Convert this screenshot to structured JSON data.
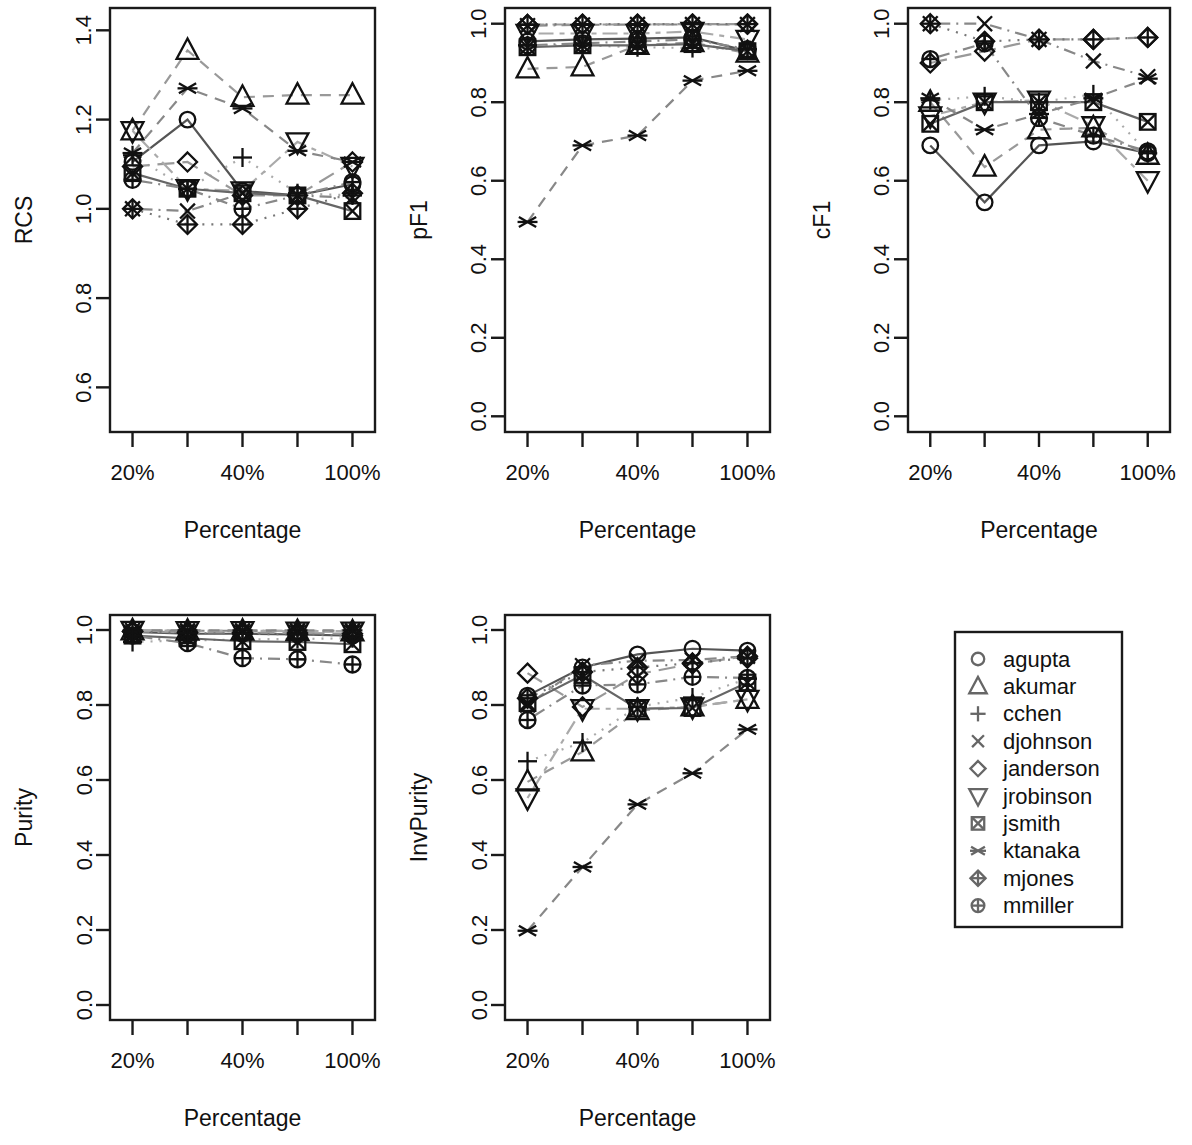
{
  "figure": {
    "type": "multi-panel-line-chart",
    "panel_count": 5,
    "x_axis_label": "Percentage",
    "x_categories": [
      "20%",
      "30%",
      "40%",
      "50%",
      "100%"
    ],
    "x_tick_labels_shown": [
      "20%",
      "",
      "40%",
      "",
      "100%"
    ]
  },
  "legend": {
    "box": true,
    "position": "bottom-right",
    "entries": [
      {
        "label": "agupta",
        "symbol": "circle",
        "pch": 1,
        "line": "solid",
        "color": "#555555"
      },
      {
        "label": "akumar",
        "symbol": "triangle-up",
        "pch": 2,
        "line": "dashed",
        "color": "#999999"
      },
      {
        "label": "cchen",
        "symbol": "plus",
        "pch": 3,
        "line": "dotted",
        "color": "#aaaaaa"
      },
      {
        "label": "djohnson",
        "symbol": "cross",
        "pch": 4,
        "line": "dotdash",
        "color": "#888888"
      },
      {
        "label": "janderson",
        "symbol": "diamond",
        "pch": 5,
        "line": "longdash",
        "color": "#999999"
      },
      {
        "label": "jrobinson",
        "symbol": "triangle-down",
        "pch": 6,
        "line": "twodash",
        "color": "#aaaaaa"
      },
      {
        "label": "jsmith",
        "symbol": "square-cross",
        "pch": 7,
        "line": "solid",
        "color": "#666666"
      },
      {
        "label": "ktanaka",
        "symbol": "asterisk",
        "pch": 8,
        "line": "dashed",
        "color": "#888888"
      },
      {
        "label": "mjones",
        "symbol": "diamond-plus",
        "pch": 9,
        "line": "dotted",
        "color": "#777777"
      },
      {
        "label": "mmiller",
        "symbol": "circle-plus",
        "pch": 10,
        "line": "dotdash",
        "color": "#888888"
      }
    ]
  },
  "chart_data": [
    {
      "type": "line",
      "title": "",
      "ylabel": "RCS",
      "xlabel": "Percentage",
      "categories": [
        "20%",
        "30%",
        "40%",
        "50%",
        "100%"
      ],
      "ylim": [
        0.5,
        1.45
      ],
      "yticks": [
        0.6,
        0.8,
        1.0,
        1.2,
        1.4
      ],
      "ytick_labels": [
        "0.6",
        "0.8",
        "1.0",
        "1.2",
        "1.4"
      ],
      "grid": false,
      "series": [
        {
          "name": "agupta",
          "values": [
            1.105,
            1.2,
            1.04,
            1.03,
            1.055
          ]
        },
        {
          "name": "akumar",
          "values": [
            1.175,
            1.355,
            1.25,
            1.255,
            1.255
          ]
        },
        {
          "name": "cchen",
          "values": [
            1.12,
            1.045,
            1.115,
            1.035,
            1.03
          ]
        },
        {
          "name": "djohnson",
          "values": [
            1.0,
            0.995,
            1.035,
            1.03,
            1.025
          ]
        },
        {
          "name": "janderson",
          "values": [
            1.095,
            1.105,
            1.03,
            1.03,
            1.105
          ]
        },
        {
          "name": "jrobinson",
          "values": [
            1.175,
            1.045,
            1.04,
            1.15,
            1.095
          ]
        },
        {
          "name": "jsmith",
          "values": [
            1.08,
            1.045,
            1.035,
            1.03,
            0.995
          ]
        },
        {
          "name": "ktanaka",
          "values": [
            1.125,
            1.27,
            1.225,
            1.13,
            1.105
          ]
        },
        {
          "name": "mjones",
          "values": [
            1.0,
            0.965,
            0.965,
            1.0,
            1.035
          ]
        },
        {
          "name": "mmiller",
          "values": [
            1.065,
            1.045,
            1.0,
            1.03,
            1.06
          ]
        }
      ]
    },
    {
      "type": "line",
      "title": "",
      "ylabel": "pF1",
      "xlabel": "Percentage",
      "categories": [
        "20%",
        "30%",
        "40%",
        "50%",
        "100%"
      ],
      "ylim": [
        -0.04,
        1.04
      ],
      "yticks": [
        0.0,
        0.2,
        0.4,
        0.6,
        0.8,
        1.0
      ],
      "ytick_labels": [
        "0.0",
        "0.2",
        "0.4",
        "0.6",
        "0.8",
        "1.0"
      ],
      "grid": false,
      "series": [
        {
          "name": "agupta",
          "values": [
            0.955,
            0.96,
            0.962,
            0.965,
            0.93
          ]
        },
        {
          "name": "akumar",
          "values": [
            0.885,
            0.89,
            0.945,
            0.952,
            0.925
          ]
        },
        {
          "name": "cchen",
          "values": [
            0.945,
            0.945,
            0.94,
            0.938,
            0.935
          ]
        },
        {
          "name": "djohnson",
          "values": [
            0.995,
            0.997,
            0.998,
            0.998,
            0.998
          ]
        },
        {
          "name": "janderson",
          "values": [
            0.998,
            0.998,
            0.998,
            0.999,
            0.999
          ]
        },
        {
          "name": "jrobinson",
          "values": [
            0.975,
            0.975,
            0.975,
            0.98,
            0.96
          ]
        },
        {
          "name": "jsmith",
          "values": [
            0.94,
            0.945,
            0.945,
            0.948,
            0.93
          ]
        },
        {
          "name": "ktanaka",
          "values": [
            0.495,
            0.69,
            0.715,
            0.855,
            0.88
          ]
        },
        {
          "name": "mjones",
          "values": [
            0.998,
            0.999,
            0.999,
            0.999,
            0.999
          ]
        },
        {
          "name": "mmiller",
          "values": [
            0.945,
            0.95,
            0.955,
            0.96,
            0.935
          ]
        }
      ]
    },
    {
      "type": "line",
      "title": "",
      "ylabel": "cF1",
      "xlabel": "Percentage",
      "categories": [
        "20%",
        "30%",
        "40%",
        "50%",
        "100%"
      ],
      "ylim": [
        -0.04,
        1.04
      ],
      "yticks": [
        0.0,
        0.2,
        0.4,
        0.6,
        0.8,
        1.0
      ],
      "ytick_labels": [
        "0.0",
        "0.2",
        "0.4",
        "0.6",
        "0.8",
        "1.0"
      ],
      "grid": false,
      "series": [
        {
          "name": "agupta",
          "values": [
            0.69,
            0.545,
            0.69,
            0.7,
            0.67
          ]
        },
        {
          "name": "akumar",
          "values": [
            0.8,
            0.635,
            0.73,
            0.735,
            0.665
          ]
        },
        {
          "name": "cchen",
          "values": [
            0.805,
            0.815,
            0.8,
            0.82,
            0.67
          ]
        },
        {
          "name": "djohnson",
          "values": [
            1.0,
            1.0,
            0.96,
            0.905,
            0.865
          ]
        },
        {
          "name": "janderson",
          "values": [
            0.9,
            0.93,
            0.96,
            0.96,
            0.965
          ]
        },
        {
          "name": "jrobinson",
          "values": [
            0.765,
            0.8,
            0.805,
            0.74,
            0.6
          ]
        },
        {
          "name": "jsmith",
          "values": [
            0.745,
            0.8,
            0.8,
            0.8,
            0.75
          ]
        },
        {
          "name": "ktanaka",
          "values": [
            0.81,
            0.73,
            0.77,
            0.81,
            0.86
          ]
        },
        {
          "name": "mjones",
          "values": [
            1.0,
            0.955,
            0.96,
            0.96,
            0.965
          ]
        },
        {
          "name": "mmiller",
          "values": [
            0.91,
            0.95,
            0.76,
            0.715,
            0.675
          ]
        }
      ]
    },
    {
      "type": "line",
      "title": "",
      "ylabel": "Purity",
      "xlabel": "Percentage",
      "categories": [
        "20%",
        "30%",
        "40%",
        "50%",
        "100%"
      ],
      "ylim": [
        -0.04,
        1.04
      ],
      "yticks": [
        0.0,
        0.2,
        0.4,
        0.6,
        0.8,
        1.0
      ],
      "ytick_labels": [
        "0.0",
        "0.2",
        "0.4",
        "0.6",
        "0.8",
        "1.0"
      ],
      "grid": false,
      "series": [
        {
          "name": "agupta",
          "values": [
            0.995,
            0.99,
            0.99,
            0.988,
            0.985
          ]
        },
        {
          "name": "akumar",
          "values": [
            0.998,
            0.997,
            0.997,
            0.996,
            0.995
          ]
        },
        {
          "name": "cchen",
          "values": [
            0.968,
            0.972,
            0.975,
            0.976,
            0.978
          ]
        },
        {
          "name": "djohnson",
          "values": [
            0.999,
            0.998,
            0.998,
            0.998,
            0.998
          ]
        },
        {
          "name": "janderson",
          "values": [
            0.996,
            0.994,
            0.993,
            0.992,
            0.99
          ]
        },
        {
          "name": "jrobinson",
          "values": [
            0.999,
            0.998,
            0.998,
            0.997,
            0.997
          ]
        },
        {
          "name": "jsmith",
          "values": [
            0.985,
            0.978,
            0.97,
            0.968,
            0.962
          ]
        },
        {
          "name": "ktanaka",
          "values": [
            0.999,
            0.999,
            0.999,
            0.999,
            0.999
          ]
        },
        {
          "name": "mjones",
          "values": [
            0.996,
            0.992,
            0.99,
            0.988,
            0.985
          ]
        },
        {
          "name": "mmiller",
          "values": [
            0.985,
            0.965,
            0.925,
            0.922,
            0.908
          ]
        }
      ]
    },
    {
      "type": "line",
      "title": "",
      "ylabel": "InvPurity",
      "xlabel": "Percentage",
      "categories": [
        "20%",
        "30%",
        "40%",
        "50%",
        "100%"
      ],
      "ylim": [
        -0.04,
        1.04
      ],
      "yticks": [
        0.0,
        0.2,
        0.4,
        0.6,
        0.8,
        1.0
      ],
      "ytick_labels": [
        "0.0",
        "0.2",
        "0.4",
        "0.6",
        "0.8",
        "1.0"
      ],
      "grid": false,
      "series": [
        {
          "name": "agupta",
          "values": [
            0.825,
            0.9,
            0.935,
            0.95,
            0.945
          ]
        },
        {
          "name": "akumar",
          "values": [
            0.595,
            0.675,
            0.785,
            0.795,
            0.815
          ]
        },
        {
          "name": "cchen",
          "values": [
            0.65,
            0.7,
            0.795,
            0.82,
            0.87
          ]
        },
        {
          "name": "djohnson",
          "values": [
            0.8,
            0.905,
            0.918,
            0.92,
            0.93
          ]
        },
        {
          "name": "janderson",
          "values": [
            0.885,
            0.795,
            0.882,
            0.91,
            0.93
          ]
        },
        {
          "name": "jrobinson",
          "values": [
            0.552,
            0.79,
            0.79,
            0.795,
            0.815
          ]
        },
        {
          "name": "jsmith",
          "values": [
            0.805,
            0.88,
            0.79,
            0.792,
            0.86
          ]
        },
        {
          "name": "ktanaka",
          "values": [
            0.198,
            0.368,
            0.535,
            0.618,
            0.735
          ]
        },
        {
          "name": "mjones",
          "values": [
            0.818,
            0.888,
            0.9,
            0.912,
            0.925
          ]
        },
        {
          "name": "mmiller",
          "values": [
            0.76,
            0.852,
            0.855,
            0.875,
            0.872
          ]
        }
      ]
    }
  ]
}
